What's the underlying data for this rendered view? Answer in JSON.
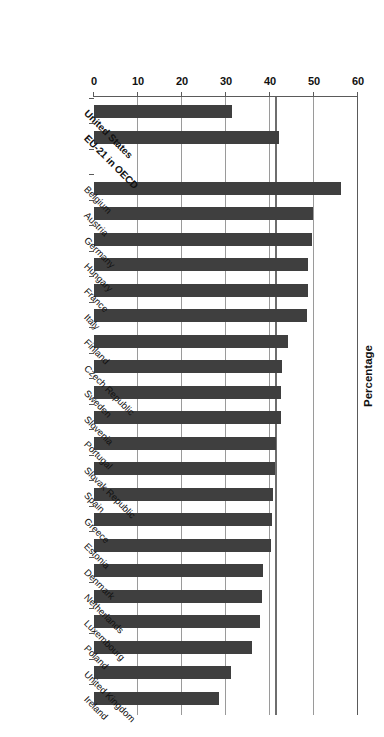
{
  "chart_data": {
    "type": "bar",
    "orientation": "horizontal",
    "title": "",
    "xlabel": "Percentage",
    "ylabel": "",
    "axis_title": "Percentage",
    "xlim": [
      0,
      60
    ],
    "xticks": [
      0,
      10,
      20,
      30,
      40,
      50,
      60
    ],
    "grid": true,
    "grid_axis": "x",
    "bar_color": "#3f3f3f",
    "reference_lines": [
      {
        "value": 40.0,
        "color": "#9a9a9a",
        "label": ""
      },
      {
        "value": 41.5,
        "color": "#6e6e6e",
        "label": ""
      }
    ],
    "categories": [
      "Ireland",
      "United Kingdom",
      "Poland",
      "Luxembourg",
      "Netherlands",
      "Denmark",
      "Estonia",
      "Greece",
      "Spain",
      "Slovak Republic",
      "Portugal",
      "Slovenia",
      "Sweden",
      "Czech Republic",
      "Finland",
      "Italy",
      "France",
      "Hungary",
      "Germany",
      "Austria",
      "Belgium",
      "",
      "EU-21 in OECD",
      "United States"
    ],
    "values": [
      28.4,
      31.2,
      35.8,
      37.7,
      38.2,
      38.3,
      40.2,
      40.4,
      40.7,
      41.1,
      41.4,
      42.4,
      42.5,
      42.7,
      44.1,
      48.5,
      48.6,
      48.7,
      49.5,
      49.8,
      56.1,
      null,
      42.0,
      31.4
    ],
    "emphasis": [
      "EU-21 in OECD",
      "United States"
    ],
    "emphasis_label_style": "bold"
  },
  "axis": {
    "tick_labels": [
      "0",
      "10",
      "20",
      "30",
      "40",
      "50",
      "60"
    ],
    "axis_title": "Percentage"
  }
}
